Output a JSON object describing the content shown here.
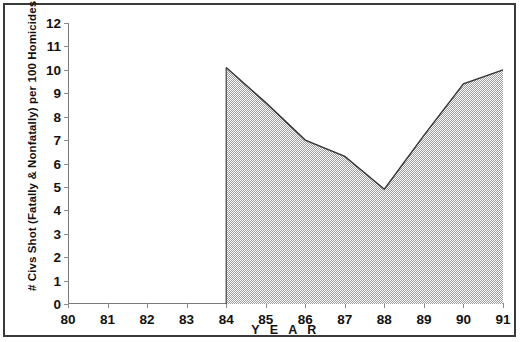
{
  "chart_data": {
    "type": "area",
    "title": "",
    "xlabel": "Y E A R",
    "ylabel": "# Civs Shot (Fatally & Nonfatally) per 100 Homicides",
    "x": [
      80,
      81,
      82,
      83,
      84,
      85,
      86,
      87,
      88,
      89,
      90,
      91
    ],
    "xtick_labels": [
      "80",
      "81",
      "82",
      "83",
      "84",
      "85",
      "86",
      "87",
      "88",
      "89",
      "90",
      "91"
    ],
    "ytick_labels": [
      "0",
      "1",
      "2",
      "3",
      "4",
      "5",
      "6",
      "7",
      "8",
      "9",
      "10",
      "11",
      "12"
    ],
    "ytick_values": [
      0,
      1,
      2,
      3,
      4,
      5,
      6,
      7,
      8,
      9,
      10,
      11,
      12
    ],
    "values": [
      null,
      null,
      null,
      null,
      10.1,
      8.6,
      7.0,
      6.3,
      4.9,
      7.2,
      9.4,
      10.0
    ],
    "series": [
      {
        "name": "# Civs Shot (Fatally & Nonfatally) per 100 Homicides",
        "x": [
          84,
          85,
          86,
          87,
          88,
          89,
          90,
          91
        ],
        "values": [
          10.1,
          8.6,
          7.0,
          6.3,
          4.9,
          7.2,
          9.4,
          10.0
        ]
      }
    ],
    "xlim": [
      80,
      91
    ],
    "ylim": [
      0,
      12
    ],
    "grid": false,
    "legend": "none",
    "fill_pattern": "50% dither checkerboard gray",
    "line_color": "#333333",
    "fill_color": "#b4b4b4",
    "axis_color": "#7a7a7a",
    "frame_color": "#3a3a3a",
    "background_color": "#ffffff"
  }
}
